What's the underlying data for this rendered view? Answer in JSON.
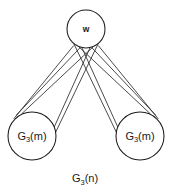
{
  "figure": {
    "caption": {
      "base": "G",
      "subscript": "3",
      "suffix": "(n)",
      "full": "G3(n)"
    },
    "background_color": "#ffffff",
    "stroke_color": "#2a2a2a",
    "node_fill_color": "#ffffff"
  },
  "nodes": {
    "top": {
      "label": "w",
      "name": "w",
      "cx": 86,
      "cy": 29,
      "r": 19
    },
    "left": {
      "base": "G",
      "subscript": "3",
      "suffix": "(m)",
      "full": "G3(m)",
      "cx": 32,
      "cy": 136,
      "r": 24
    },
    "right": {
      "base": "G",
      "subscript": "3",
      "suffix": "(m)",
      "full": "G3(m)",
      "cx": 140,
      "cy": 136,
      "r": 24
    }
  },
  "edges": {
    "count": 10,
    "description": "fan of straight lines from w to both G3(m) subgraphs, crossing below w"
  }
}
